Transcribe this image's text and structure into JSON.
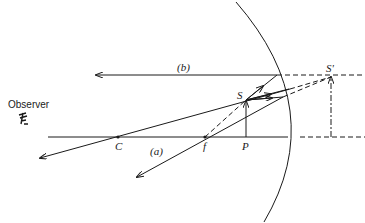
{
  "diagram": {
    "labels": {
      "observer": "Observer",
      "center_of_curvature": "C",
      "focal_point": "f",
      "object_base": "P",
      "object_tip": "S",
      "image_tip": "S'",
      "ray_a": "(a)",
      "ray_b": "(b)"
    },
    "icons": {
      "observer": "eye-icon"
    },
    "colors": {
      "line": "#1a1a1a",
      "background": "#ffffff"
    }
  }
}
